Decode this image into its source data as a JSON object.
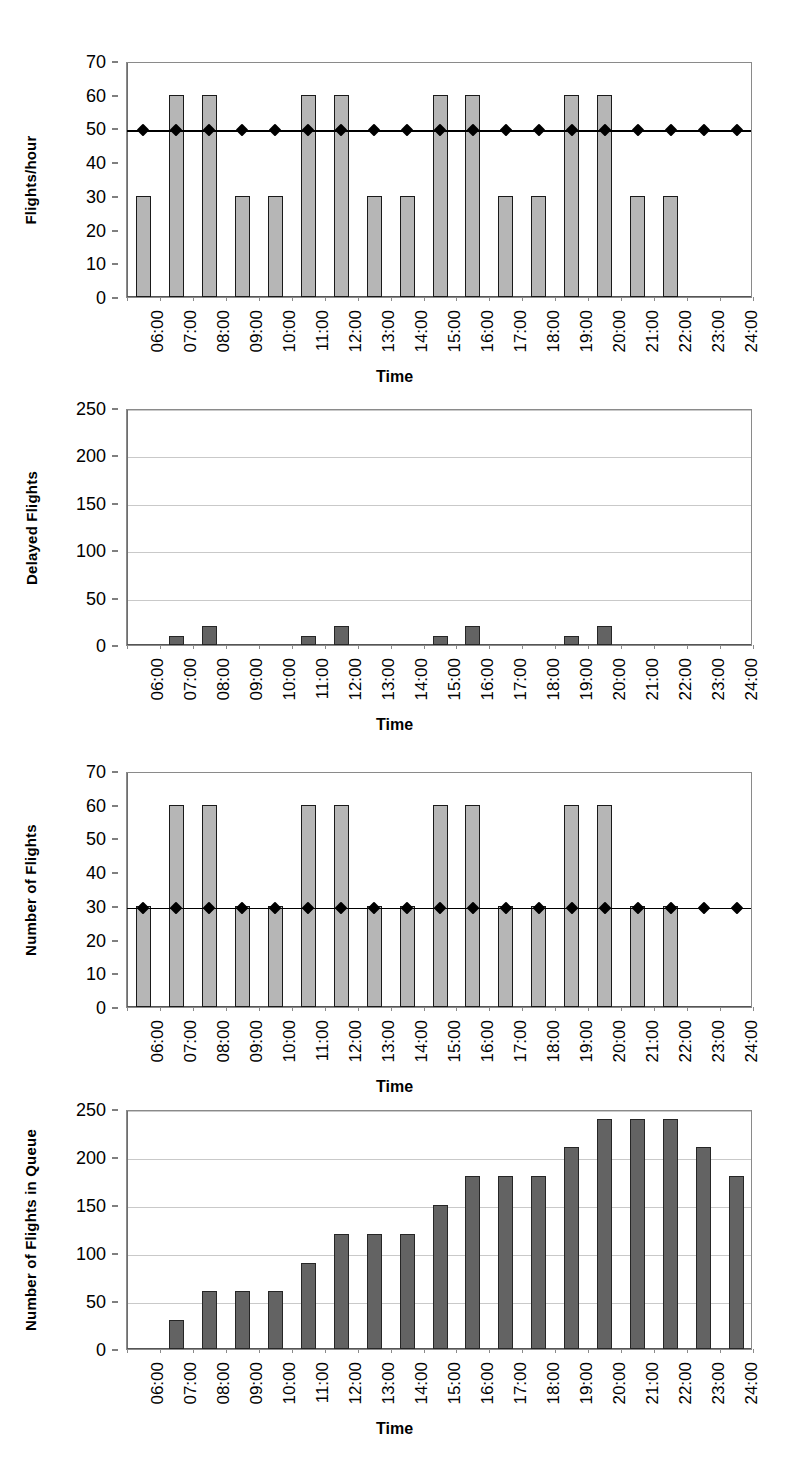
{
  "figure": {
    "caption": "",
    "shared_xlabel": "Time",
    "categories": [
      "06:00",
      "07:00",
      "08:00",
      "09:00",
      "10:00",
      "11:00",
      "12:00",
      "13:00",
      "14:00",
      "15:00",
      "16:00",
      "17:00",
      "18:00",
      "19:00",
      "20:00",
      "21:00",
      "22:00",
      "23:00",
      "24:00"
    ],
    "colors": {
      "bar_light": "#b6b6b6",
      "bar_dark": "#636363",
      "bar_outline": "#1a1a1a",
      "gridline": "#c9c9c9",
      "axis": "#8a8a8a",
      "line_series": "#000000"
    }
  },
  "chart_data": [
    {
      "type": "bar",
      "title": "",
      "xlabel": "Time",
      "ylabel": "Flights/hour",
      "categories": [
        "06:00",
        "07:00",
        "08:00",
        "09:00",
        "10:00",
        "11:00",
        "12:00",
        "13:00",
        "14:00",
        "15:00",
        "16:00",
        "17:00",
        "18:00",
        "19:00",
        "20:00",
        "21:00",
        "22:00",
        "23:00",
        "24:00"
      ],
      "ylim": [
        0,
        70
      ],
      "yticks": [
        0,
        10,
        20,
        30,
        40,
        50,
        60,
        70
      ],
      "ytick_labels": [
        "0",
        "10",
        "20",
        "30",
        "40",
        "50",
        "60",
        "70"
      ],
      "grid": false,
      "legend": "none",
      "series": [
        {
          "name": "Flights/hour",
          "kind": "bar",
          "style": "light",
          "values": [
            30,
            60,
            60,
            30,
            30,
            60,
            60,
            30,
            30,
            60,
            60,
            30,
            30,
            60,
            60,
            30,
            30,
            0,
            0
          ]
        },
        {
          "name": "Capacity",
          "kind": "line-marker",
          "style": "black-diamond",
          "values": [
            50,
            50,
            50,
            50,
            50,
            50,
            50,
            50,
            50,
            50,
            50,
            50,
            50,
            50,
            50,
            50,
            50,
            50,
            50
          ]
        }
      ]
    },
    {
      "type": "bar",
      "title": "",
      "xlabel": "Time",
      "ylabel": "Delayed Flights",
      "categories": [
        "06:00",
        "07:00",
        "08:00",
        "09:00",
        "10:00",
        "11:00",
        "12:00",
        "13:00",
        "14:00",
        "15:00",
        "16:00",
        "17:00",
        "18:00",
        "19:00",
        "20:00",
        "21:00",
        "22:00",
        "23:00",
        "24:00"
      ],
      "ylim": [
        0,
        250
      ],
      "yticks": [
        0,
        50,
        100,
        150,
        200,
        250
      ],
      "ytick_labels": [
        "0",
        "50",
        "100",
        "150",
        "200",
        "250"
      ],
      "grid": true,
      "legend": "none",
      "series": [
        {
          "name": "Delayed Flights",
          "kind": "bar",
          "style": "dark",
          "values": [
            0,
            10,
            20,
            0,
            0,
            10,
            20,
            0,
            0,
            10,
            20,
            0,
            0,
            10,
            20,
            0,
            0,
            0,
            0
          ]
        }
      ]
    },
    {
      "type": "bar",
      "title": "",
      "xlabel": "Time",
      "ylabel": "Number of Flights",
      "categories": [
        "06:00",
        "07:00",
        "08:00",
        "09:00",
        "10:00",
        "11:00",
        "12:00",
        "13:00",
        "14:00",
        "15:00",
        "16:00",
        "17:00",
        "18:00",
        "19:00",
        "20:00",
        "21:00",
        "22:00",
        "23:00",
        "24:00"
      ],
      "ylim": [
        0,
        70
      ],
      "yticks": [
        0,
        10,
        20,
        30,
        40,
        50,
        60,
        70
      ],
      "ytick_labels": [
        "0",
        "10",
        "20",
        "30",
        "40",
        "50",
        "60",
        "70"
      ],
      "grid": false,
      "legend": "none",
      "series": [
        {
          "name": "Number of Flights",
          "kind": "bar",
          "style": "light",
          "values": [
            30,
            60,
            60,
            30,
            30,
            60,
            60,
            30,
            30,
            60,
            60,
            30,
            30,
            60,
            60,
            30,
            30,
            0,
            0
          ]
        },
        {
          "name": "Capacity",
          "kind": "line-marker",
          "style": "black-diamond",
          "values": [
            30,
            30,
            30,
            30,
            30,
            30,
            30,
            30,
            30,
            30,
            30,
            30,
            30,
            30,
            30,
            30,
            30,
            30,
            30
          ]
        }
      ]
    },
    {
      "type": "bar",
      "title": "",
      "xlabel": "Time",
      "ylabel": "Number of Flights in Queue",
      "categories": [
        "06:00",
        "07:00",
        "08:00",
        "09:00",
        "10:00",
        "11:00",
        "12:00",
        "13:00",
        "14:00",
        "15:00",
        "16:00",
        "17:00",
        "18:00",
        "19:00",
        "20:00",
        "21:00",
        "22:00",
        "23:00",
        "24:00"
      ],
      "ylim": [
        0,
        250
      ],
      "yticks": [
        0,
        50,
        100,
        150,
        200,
        250
      ],
      "ytick_labels": [
        "0",
        "50",
        "100",
        "150",
        "200",
        "250"
      ],
      "grid": true,
      "legend": "none",
      "series": [
        {
          "name": "Number of Flights in Queue",
          "kind": "bar",
          "style": "dark",
          "values": [
            0,
            30,
            60,
            60,
            60,
            90,
            120,
            120,
            120,
            150,
            180,
            180,
            180,
            210,
            240,
            240,
            240,
            210,
            180
          ]
        }
      ]
    }
  ]
}
